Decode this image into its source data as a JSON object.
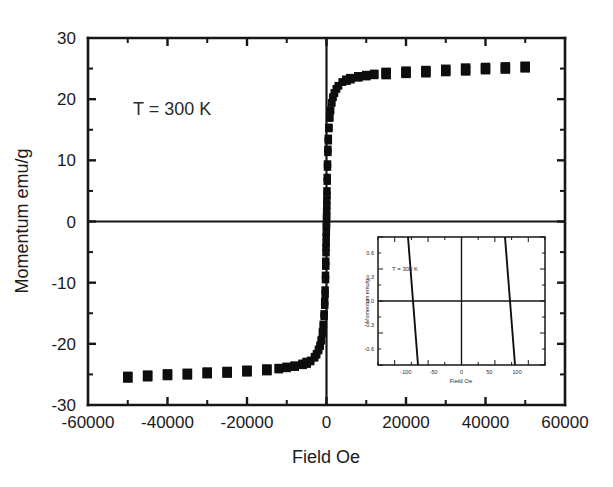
{
  "chart_data": {
    "type": "scatter",
    "title": "",
    "xlabel": "Field Oe",
    "ylabel": "Momentum emu/g",
    "xlim": [
      -60000,
      60000
    ],
    "ylim": [
      -30,
      30
    ],
    "xticks": [
      -60000,
      -40000,
      -20000,
      0,
      20000,
      40000,
      60000
    ],
    "xtick_labels": [
      "-60000",
      "-40000",
      "-20000",
      "0",
      "20000",
      "40000",
      "60000"
    ],
    "yticks": [
      -30,
      -20,
      -10,
      0,
      10,
      20,
      30
    ],
    "ytick_labels": [
      "-30",
      "-20",
      "-10",
      "0",
      "10",
      "20",
      "30"
    ],
    "x_minor_interval": 10000,
    "y_minor_interval": 5,
    "grid": false,
    "legend": null,
    "annotations": [
      {
        "text": "T = 300 K",
        "x": -42000,
        "y": 19.5
      }
    ],
    "marker": "square",
    "marker_color": "#0d0d0d",
    "series": [
      {
        "name": "Branch descending (+H to -H)",
        "x": [
          50000,
          45000,
          40000,
          35000,
          30000,
          25000,
          20000,
          15000,
          12000,
          10000,
          8000,
          6000,
          5000,
          4000,
          3000,
          2500,
          2000,
          1600,
          1300,
          1000,
          800,
          600,
          450,
          350,
          250,
          180,
          120,
          80,
          40,
          0,
          -40,
          -80,
          -120,
          -180,
          -250,
          -350,
          -450,
          -600,
          -800,
          -1000,
          -1300,
          -1600,
          -2000,
          -2500,
          -3000,
          -4000,
          -5000,
          -6000,
          -8000,
          -10000,
          -12000,
          -15000,
          -20000,
          -25000,
          -30000,
          -35000,
          -40000,
          -45000,
          -50000
        ],
        "y": [
          25.2,
          25.0,
          24.9,
          24.7,
          24.6,
          24.4,
          24.3,
          24.1,
          24.0,
          23.8,
          23.6,
          23.3,
          23.1,
          22.8,
          22.2,
          21.7,
          21.0,
          20.3,
          19.4,
          18.2,
          17.0,
          15.4,
          13.6,
          11.8,
          9.4,
          7.2,
          5.0,
          3.4,
          1.7,
          0.5,
          -0.8,
          -2.5,
          -4.2,
          -6.5,
          -8.8,
          -11.2,
          -13.1,
          -15.1,
          -16.8,
          -18.0,
          -19.3,
          -20.2,
          -20.9,
          -21.6,
          -22.1,
          -22.7,
          -23.0,
          -23.3,
          -23.6,
          -23.8,
          -24.0,
          -24.2,
          -24.4,
          -24.6,
          -24.7,
          -24.9,
          -25.0,
          -25.2,
          -25.4
        ],
        "values_note": "upper/forward branch of hysteresis loop"
      },
      {
        "name": "Branch ascending (-H to +H)",
        "x": [
          -50000,
          -45000,
          -40000,
          -35000,
          -30000,
          -25000,
          -20000,
          -15000,
          -12000,
          -10000,
          -8000,
          -6000,
          -5000,
          -4000,
          -3000,
          -2500,
          -2000,
          -1600,
          -1300,
          -1000,
          -800,
          -600,
          -450,
          -350,
          -250,
          -180,
          -120,
          -80,
          -40,
          0,
          40,
          80,
          120,
          180,
          250,
          350,
          450,
          600,
          800,
          1000,
          1300,
          1600,
          2000,
          2500,
          3000,
          4000,
          5000,
          6000,
          8000,
          10000,
          12000,
          15000,
          20000,
          25000,
          30000,
          35000,
          40000,
          45000,
          50000
        ],
        "y": [
          -25.5,
          -25.3,
          -25.1,
          -25.0,
          -24.8,
          -24.7,
          -24.5,
          -24.3,
          -24.1,
          -23.9,
          -23.7,
          -23.4,
          -23.2,
          -22.9,
          -22.3,
          -21.8,
          -21.1,
          -20.4,
          -19.5,
          -18.3,
          -17.1,
          -15.5,
          -13.7,
          -11.9,
          -9.5,
          -7.3,
          -5.1,
          -3.5,
          -1.8,
          -0.5,
          0.9,
          2.6,
          4.3,
          6.6,
          8.9,
          11.3,
          13.2,
          15.2,
          16.9,
          18.1,
          19.4,
          20.3,
          21.0,
          21.7,
          22.2,
          22.8,
          23.1,
          23.4,
          23.7,
          23.9,
          24.1,
          24.3,
          24.5,
          24.6,
          24.8,
          25.0,
          25.1,
          25.2,
          25.3
        ],
        "values_note": "lower/reverse branch of hysteresis loop"
      }
    ],
    "saturation_magnetization": 25.3,
    "inset": {
      "type": "line",
      "xlabel": "Field Oe",
      "ylabel": "Momentum emu/g",
      "annotations": [
        {
          "text": "T = 300 K"
        }
      ],
      "xlim": [
        -150,
        150
      ],
      "ylim": [
        -0.8,
        0.8
      ],
      "xticks": [
        -100,
        -50,
        0,
        50,
        100
      ],
      "yticks": [
        -0.6,
        -0.3,
        0.0,
        0.3,
        0.6
      ],
      "series": [
        {
          "name": "descending",
          "note": "steep near-vertical branch, negative coercive offset"
        },
        {
          "name": "ascending",
          "note": "steep near-vertical branch, positive coercive offset"
        }
      ]
    }
  }
}
